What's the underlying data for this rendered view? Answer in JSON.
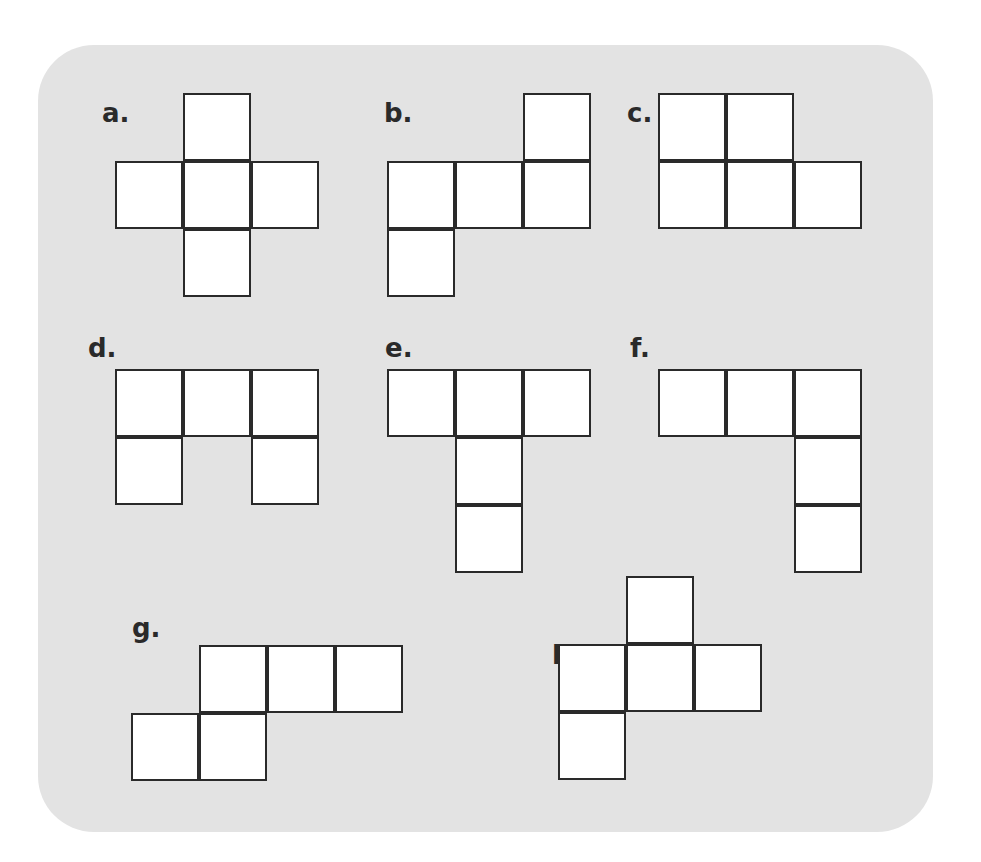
{
  "figure": {
    "background_color": "#e3e3e3",
    "cell_fill": "#ffffff",
    "stroke_color": "#2a2a2a",
    "cell_size": 68
  },
  "nets": [
    {
      "id": "a",
      "label": "a.",
      "label_pos": [
        102,
        100
      ],
      "origin": [
        115,
        93
      ],
      "cells": [
        [
          1,
          0
        ],
        [
          0,
          1
        ],
        [
          1,
          1
        ],
        [
          2,
          1
        ],
        [
          1,
          2
        ]
      ]
    },
    {
      "id": "b",
      "label": "b.",
      "label_pos": [
        384,
        100
      ],
      "origin": [
        387,
        93
      ],
      "cells": [
        [
          2,
          0
        ],
        [
          0,
          1
        ],
        [
          1,
          1
        ],
        [
          2,
          1
        ],
        [
          0,
          2
        ]
      ]
    },
    {
      "id": "c",
      "label": "c.",
      "label_pos": [
        627,
        100
      ],
      "origin": [
        658,
        93
      ],
      "cells": [
        [
          0,
          0
        ],
        [
          1,
          0
        ],
        [
          0,
          1
        ],
        [
          1,
          1
        ],
        [
          2,
          1
        ]
      ]
    },
    {
      "id": "d",
      "label": "d.",
      "label_pos": [
        88,
        335
      ],
      "origin": [
        115,
        369
      ],
      "cells": [
        [
          0,
          0
        ],
        [
          1,
          0
        ],
        [
          2,
          0
        ],
        [
          0,
          1
        ],
        [
          2,
          1
        ]
      ]
    },
    {
      "id": "e",
      "label": "e.",
      "label_pos": [
        385,
        335
      ],
      "origin": [
        387,
        369
      ],
      "cells": [
        [
          0,
          0
        ],
        [
          1,
          0
        ],
        [
          2,
          0
        ],
        [
          1,
          1
        ],
        [
          1,
          2
        ]
      ]
    },
    {
      "id": "f",
      "label": "f.",
      "label_pos": [
        630,
        335
      ],
      "origin": [
        658,
        369
      ],
      "cells": [
        [
          0,
          0
        ],
        [
          1,
          0
        ],
        [
          2,
          0
        ],
        [
          2,
          1
        ],
        [
          2,
          2
        ]
      ]
    },
    {
      "id": "g",
      "label": "g.",
      "label_pos": [
        132,
        615
      ],
      "origin": [
        131,
        645
      ],
      "cells": [
        [
          1,
          0
        ],
        [
          2,
          0
        ],
        [
          3,
          0
        ],
        [
          0,
          1
        ],
        [
          1,
          1
        ]
      ]
    },
    {
      "id": "h",
      "label": "h.",
      "label_pos": [
        552,
        642
      ],
      "origin": [
        558,
        576
      ],
      "cells": [
        [
          1,
          0
        ],
        [
          0,
          1
        ],
        [
          1,
          1
        ],
        [
          2,
          1
        ],
        [
          0,
          2
        ]
      ]
    }
  ]
}
